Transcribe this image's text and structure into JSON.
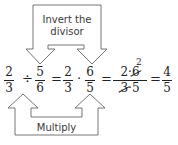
{
  "top_box": {
    "label_line1": "Invert the",
    "label_line2": "divisor"
  },
  "bottom_box": {
    "label": "Multiply"
  },
  "equation": {
    "fractions": [
      {
        "num": "2",
        "den": "3"
      },
      {
        "num": "5",
        "den": "6"
      },
      {
        "num": "2",
        "den": "3"
      },
      {
        "num": "6",
        "den": "5"
      },
      {
        "num_left": "2",
        "num_dot": "·",
        "num_right": "6",
        "den_left": "3",
        "den_dot": "·",
        "den_right": "5",
        "cancel_result": "2"
      },
      {
        "num": "4",
        "den": "5"
      }
    ],
    "operators": [
      "÷",
      "=",
      "·",
      "=",
      "="
    ]
  },
  "colors": {
    "stroke": "#555555",
    "text": "#222222"
  }
}
